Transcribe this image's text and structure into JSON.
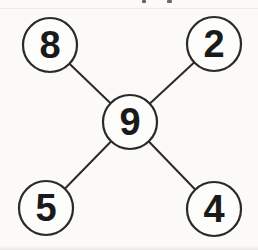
{
  "diagram": {
    "canvas": {
      "width": 258,
      "height": 250
    },
    "colors": {
      "background": "#fbfaf7",
      "node_fill": "#fdfdfb",
      "stroke": "#2a2a2a",
      "digit": "#1a1a1a"
    },
    "stroke_width_circle": 2.2,
    "stroke_width_edge": 2,
    "digit_font_size": 38,
    "nodes": [
      {
        "id": "top-left",
        "value": "8",
        "cx": 50,
        "cy": 45,
        "r": 27
      },
      {
        "id": "top-right",
        "value": "2",
        "cx": 214,
        "cy": 44,
        "r": 27
      },
      {
        "id": "center",
        "value": "9",
        "cx": 130,
        "cy": 122,
        "r": 27
      },
      {
        "id": "bottom-left",
        "value": "5",
        "cx": 46,
        "cy": 208,
        "r": 27
      },
      {
        "id": "bottom-right",
        "value": "4",
        "cx": 214,
        "cy": 209,
        "r": 27
      }
    ],
    "edges": [
      {
        "from": "center",
        "to": "top-left"
      },
      {
        "from": "center",
        "to": "top-right"
      },
      {
        "from": "center",
        "to": "bottom-left"
      },
      {
        "from": "center",
        "to": "bottom-right"
      }
    ],
    "artifacts": [
      {
        "name": "cutoff-text-mark",
        "x": 142,
        "y": 0,
        "w": 4,
        "h": 3,
        "color": "#4d4a45"
      },
      {
        "name": "cutoff-text-mark",
        "x": 167,
        "y": 0,
        "w": 5,
        "h": 3,
        "color": "#55524c"
      }
    ]
  }
}
